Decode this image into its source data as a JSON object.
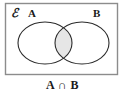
{
  "figure": {
    "caption": "A ∩ B",
    "universe_symbol": "ℰ",
    "background_color": "#ffffff",
    "frame": {
      "label": "universal-set-rectangle",
      "stroke_color": "#8c8c8c",
      "fill_color": "#ffffff",
      "x": 5,
      "y": 3,
      "width": 113,
      "height": 72
    },
    "sets": [
      {
        "name": "A",
        "label": "A",
        "shape": "ellipse",
        "cx": 45,
        "cy": 43,
        "rx": 27,
        "ry": 21,
        "stroke_color": "#2b2b2b",
        "fill_color": "#ffffff",
        "label_x": 29,
        "label_y": 16
      },
      {
        "name": "B",
        "label": "B",
        "shape": "ellipse",
        "cx": 82,
        "cy": 43,
        "rx": 27,
        "ry": 21,
        "stroke_color": "#2b2b2b",
        "fill_color": "#ffffff",
        "label_x": 94,
        "label_y": 16
      }
    ],
    "shaded_region": {
      "name": "intersection",
      "description": "A ∩ B",
      "fill_color": "#e6e6e6",
      "stroke_color": "#2b2b2b"
    }
  }
}
